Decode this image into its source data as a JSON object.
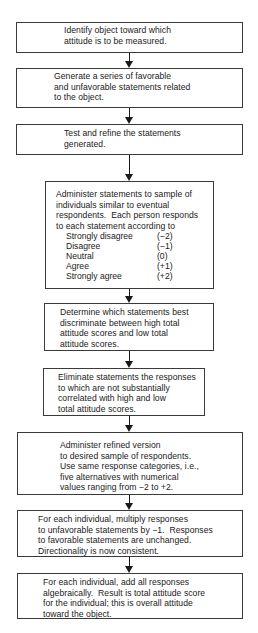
{
  "flowchart": {
    "steps": [
      {
        "id": "identify",
        "lines": [
          "Identify object toward which",
          "attitude is to be measured."
        ]
      },
      {
        "id": "generate",
        "lines": [
          "Generate a series of favorable",
          "and unfavorable statements related",
          "to the object."
        ]
      },
      {
        "id": "test",
        "lines": [
          "Test and refine the statements",
          "generated."
        ]
      },
      {
        "id": "administer-sample",
        "lines": [
          "Administer statements to sample of",
          "individuals similar to eventual",
          "respondents.  Each person responds",
          "to each statement according to"
        ],
        "scale": [
          {
            "label": "Strongly disagree",
            "value": "(−2)"
          },
          {
            "label": "Disagree",
            "value": "(−1)"
          },
          {
            "label": "Neutral",
            "value": "(0)"
          },
          {
            "label": "Agree",
            "value": "(+1)"
          },
          {
            "label": "Strongly agree",
            "value": "(+2)"
          }
        ]
      },
      {
        "id": "determine",
        "lines": [
          "Determine which statements best",
          "discriminate between high total",
          "attitude scores and low total",
          "attitude scores."
        ]
      },
      {
        "id": "eliminate",
        "lines": [
          "Eliminate statements the responses",
          "to which are not substantially",
          "correlated with high and low",
          "total attitude scores."
        ]
      },
      {
        "id": "administer-refined",
        "lines": [
          "Administer refined version",
          "to desired sample of respondents.",
          "Use same response categories, i.e.,",
          "five alternatives with numerical",
          "values ranging from −2 to +2."
        ]
      },
      {
        "id": "multiply",
        "lines": [
          "For each individual, multiply responses",
          "to unfavorable statements by −1.  Responses",
          "to favorable statements are unchanged.",
          "Directionality is now consistent."
        ]
      },
      {
        "id": "sum",
        "lines": [
          "For each individual, add all responses",
          "algebraically.  Result is total attitude score",
          "for the individual; this is overall attitude",
          "toward the object."
        ]
      }
    ]
  }
}
